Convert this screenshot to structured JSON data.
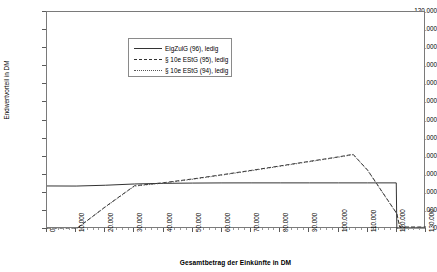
{
  "chart_data": {
    "type": "line",
    "title": "",
    "xlabel": "Gesamtbetrag der Einkünfte in DM",
    "ylabel": "Endwertvorteil in DM",
    "xlim": [
      0,
      130000
    ],
    "ylim": [
      0,
      120000
    ],
    "xticks": [
      "0",
      "10.000",
      "20.000",
      "30.000",
      "40.000",
      "50.000",
      "60.000",
      "70.000",
      "80.000",
      "90.000",
      "100.000",
      "110.000",
      "120.000",
      "130.000"
    ],
    "xtick_values": [
      0,
      10000,
      20000,
      30000,
      40000,
      50000,
      60000,
      70000,
      80000,
      90000,
      100000,
      110000,
      120000,
      130000
    ],
    "yticks": [
      "0",
      "10.000",
      "20.000",
      "30.000",
      "40.000",
      "50.000",
      "60.000",
      "70.000",
      "80.000",
      "90.000",
      "100.000",
      "110.000",
      "120.000"
    ],
    "ytick_values": [
      0,
      10000,
      20000,
      30000,
      40000,
      50000,
      60000,
      70000,
      80000,
      90000,
      100000,
      110000,
      120000
    ],
    "grid": false,
    "legend_position": "upper-center",
    "series": [
      {
        "name": "EigZulG (96), ledig",
        "style": "solid",
        "color": "#333333",
        "points": [
          [
            0,
            23800
          ],
          [
            10000,
            23750
          ],
          [
            20000,
            24200
          ],
          [
            30000,
            24900
          ],
          [
            40000,
            25250
          ],
          [
            50000,
            25400
          ],
          [
            60000,
            25480
          ],
          [
            70000,
            25500
          ],
          [
            80000,
            25500
          ],
          [
            90000,
            25500
          ],
          [
            100000,
            25500
          ],
          [
            110000,
            25500
          ],
          [
            119800,
            25500
          ],
          [
            120000,
            0
          ],
          [
            130000,
            0
          ]
        ]
      },
      {
        "name": "§ 10e EStG (95), ledig",
        "style": "dashed",
        "color": "#333333",
        "points": [
          [
            0,
            0
          ],
          [
            10000,
            0
          ],
          [
            20000,
            12300
          ],
          [
            30000,
            23900
          ],
          [
            40000,
            25600
          ],
          [
            50000,
            27700
          ],
          [
            60000,
            30000
          ],
          [
            70000,
            32400
          ],
          [
            80000,
            34900
          ],
          [
            90000,
            37400
          ],
          [
            100000,
            39900
          ],
          [
            105000,
            41300
          ],
          [
            110000,
            32500
          ],
          [
            120000,
            8500
          ],
          [
            121000,
            1100
          ],
          [
            130000,
            1100
          ]
        ]
      },
      {
        "name": "§ 10e EStG (94), ledig",
        "style": "dotted",
        "color": "#555555",
        "points": [
          [
            0,
            0
          ],
          [
            10000,
            0
          ],
          [
            20000,
            12100
          ],
          [
            30000,
            23700
          ],
          [
            40000,
            25400
          ],
          [
            50000,
            27500
          ],
          [
            60000,
            29800
          ],
          [
            70000,
            32200
          ],
          [
            80000,
            34700
          ],
          [
            90000,
            37200
          ],
          [
            100000,
            39700
          ],
          [
            105000,
            41100
          ],
          [
            110000,
            32300
          ],
          [
            120000,
            8300
          ],
          [
            121000,
            900
          ],
          [
            130000,
            900
          ]
        ]
      }
    ]
  }
}
